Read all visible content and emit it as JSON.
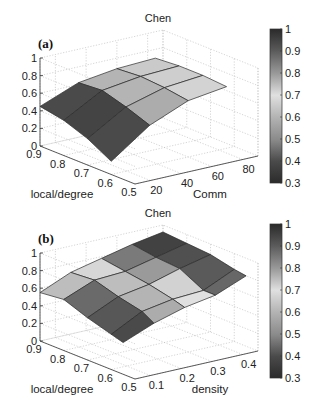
{
  "chart_data": [
    {
      "type": "surface",
      "panel_label": "(a)",
      "title": "Chen",
      "xlabel": "Comm",
      "ylabel": "local/degree",
      "zlabel": "",
      "x_ticks": [
        "20",
        "40",
        "60",
        "80"
      ],
      "y_ticks": [
        "0.9",
        "0.8",
        "0.7",
        "0.6",
        "0.5"
      ],
      "z_ticks": [
        "0",
        "0.2",
        "0.4",
        "0.6",
        "0.8",
        "1"
      ],
      "colorbar_ticks": [
        "1",
        "0.9",
        "0.8",
        "0.7",
        "0.6",
        "0.5",
        "0.4",
        "0.3"
      ],
      "xlim": [
        10,
        90
      ],
      "ylim": [
        0.5,
        0.9
      ],
      "zlim": [
        0,
        1
      ],
      "clim": [
        0.3,
        1
      ],
      "x": [
        10,
        35,
        60,
        85
      ],
      "y": [
        0.9,
        0.8,
        0.7,
        0.6
      ],
      "z": [
        [
          0.45,
          0.62,
          0.68,
          0.7
        ],
        [
          0.4,
          0.64,
          0.7,
          0.72
        ],
        [
          0.3,
          0.56,
          0.68,
          0.72
        ],
        [
          0.15,
          0.46,
          0.64,
          0.7
        ]
      ],
      "cell_values": [
        [
          0.4,
          0.6,
          0.65
        ],
        [
          0.38,
          0.6,
          0.66
        ],
        [
          0.4,
          0.58,
          0.67
        ]
      ]
    },
    {
      "type": "surface",
      "panel_label": "(b)",
      "title": "Chen",
      "xlabel": "density",
      "ylabel": "local/degree",
      "zlabel": "",
      "x_ticks": [
        "0.1",
        "0.2",
        "0.3",
        "0.4"
      ],
      "y_ticks": [
        "0.9",
        "0.8",
        "0.7",
        "0.6",
        "0.5"
      ],
      "z_ticks": [
        "0",
        "0.2",
        "0.4",
        "0.6",
        "0.8",
        "1"
      ],
      "colorbar_ticks": [
        "1",
        "0.9",
        "0.8",
        "0.7",
        "0.6",
        "0.5",
        "0.4",
        "0.3"
      ],
      "xlim": [
        0.05,
        0.45
      ],
      "ylim": [
        0.5,
        0.9
      ],
      "zlim": [
        0,
        1
      ],
      "clim": [
        0.3,
        1
      ],
      "x": [
        0.05,
        0.15,
        0.25,
        0.35,
        0.45
      ],
      "y": [
        0.9,
        0.8,
        0.7,
        0.6,
        0.55
      ],
      "z": [
        [
          0.55,
          0.7,
          0.78,
          0.86,
          0.92
        ],
        [
          0.58,
          0.72,
          0.74,
          0.82,
          0.9
        ],
        [
          0.48,
          0.64,
          0.7,
          0.8,
          0.88
        ],
        [
          0.4,
          0.58,
          0.64,
          0.66,
          0.82
        ],
        [
          0.36,
          0.5,
          0.6,
          0.66,
          0.8
        ]
      ],
      "cell_values": [
        [
          0.62,
          0.68,
          0.85,
          0.95
        ],
        [
          0.45,
          0.62,
          0.8,
          0.92
        ],
        [
          0.42,
          0.6,
          0.72,
          0.9
        ],
        [
          0.4,
          0.58,
          0.7,
          0.88
        ]
      ]
    }
  ],
  "colors": {
    "background": "#ffffff",
    "colormap": "gray-like (dark at 0.3, light near 0.7, dark at 1)"
  }
}
